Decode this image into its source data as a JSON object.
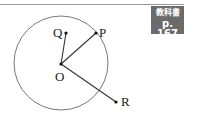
{
  "badge": {
    "line1": "教科書",
    "line2": "p. 167"
  },
  "diagram": {
    "circle": {
      "cx": 61,
      "cy": 63,
      "r": 47,
      "stroke": "#777777"
    },
    "points": {
      "O": {
        "x": 61,
        "y": 64,
        "label": "O"
      },
      "P": {
        "x": 96,
        "y": 33,
        "label": "P"
      },
      "Q": {
        "x": 66,
        "y": 33,
        "label": "Q"
      },
      "R": {
        "x": 116,
        "y": 102,
        "label": "R"
      }
    },
    "segments": [
      "OP",
      "OQ",
      "OR"
    ]
  }
}
